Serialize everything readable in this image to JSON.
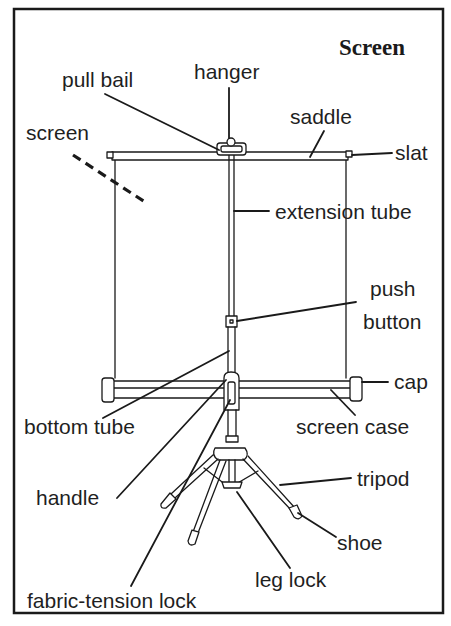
{
  "title": "Screen",
  "labels": {
    "pull_bail": "pull bail",
    "hanger": "hanger",
    "saddle": "saddle",
    "screen": "screen",
    "slat": "slat",
    "extension_tube": "extension tube",
    "push": "push",
    "button": "button",
    "cap": "cap",
    "bottom_tube": "bottom tube",
    "screen_case": "screen case",
    "tripod": "tripod",
    "handle": "handle",
    "shoe": "shoe",
    "leg_lock": "leg lock",
    "fabric_tension_lock": "fabric-tension lock"
  },
  "parts": [
    "screen",
    "pull bail",
    "hanger",
    "saddle",
    "slat",
    "extension tube",
    "push button",
    "cap",
    "bottom tube",
    "screen case",
    "tripod",
    "handle",
    "shoe",
    "leg lock",
    "fabric-tension lock"
  ]
}
